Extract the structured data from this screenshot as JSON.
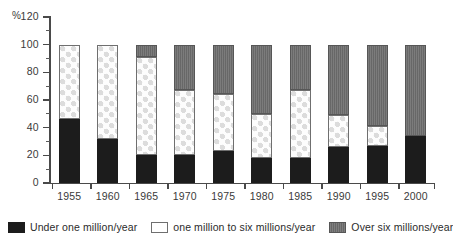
{
  "chart_data": {
    "type": "bar",
    "subtype": "stacked-column-100",
    "title": "",
    "xlabel": "",
    "ylabel": "%",
    "ylim": [
      0,
      120
    ],
    "ytick_labels": [
      "0",
      "20",
      "40",
      "60",
      "80",
      "100",
      "120"
    ],
    "ytick_values": [
      0,
      20,
      40,
      60,
      80,
      100,
      120
    ],
    "yminor_step": 10,
    "grid": false,
    "legend_position": "bottom",
    "categories": [
      "1955",
      "1960",
      "1965",
      "1970",
      "1975",
      "1980",
      "1985",
      "1990",
      "1995",
      "2000"
    ],
    "series": [
      {
        "name": "Under one million/year",
        "key": "low",
        "color": "#1c1c1c",
        "pattern": "solid-black",
        "values": [
          46,
          32,
          20,
          20,
          23,
          18,
          18,
          26,
          27,
          34
        ]
      },
      {
        "name": "one million to six millions/year",
        "key": "mid",
        "color": "#ffffff",
        "pattern": "checkered",
        "values": [
          54,
          68,
          71,
          47,
          41,
          32,
          49,
          23,
          14,
          0
        ]
      },
      {
        "name": "Over six millions/year",
        "key": "high",
        "color": "#6d6d6d",
        "pattern": "dark-grey",
        "values": [
          0,
          0,
          9,
          33,
          36,
          50,
          33,
          51,
          59,
          66
        ]
      }
    ],
    "cumulative_tops": {
      "low": [
        46,
        32,
        20,
        20,
        23,
        18,
        18,
        26,
        27,
        34
      ],
      "mid": [
        100,
        100,
        91,
        67,
        64,
        50,
        67,
        49,
        41,
        34
      ],
      "high": [
        100,
        100,
        100,
        100,
        100,
        100,
        100,
        100,
        100,
        100
      ]
    }
  },
  "legend": {
    "items": [
      {
        "label": "Under one million/year"
      },
      {
        "label": "one million to six millions/year"
      },
      {
        "label": "Over six millions/year"
      }
    ]
  }
}
